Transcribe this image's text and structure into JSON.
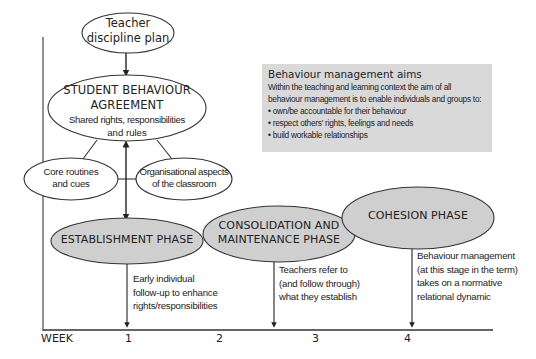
{
  "diagram": {
    "teacher_plan": {
      "line1": "Teacher",
      "line2": "discipline plan"
    },
    "agreement": {
      "title_line1": "STUDENT BEHAVIOUR",
      "title_line2": "AGREEMENT",
      "sub_line1": "Shared rights, responsibilities",
      "sub_line2": "and rules"
    },
    "core_routines": {
      "line1": "Core routines",
      "line2": "and cues"
    },
    "organisational": {
      "line1": "Organisational aspects",
      "line2": "of the classroom"
    },
    "aims": {
      "title": "Behaviour management aims",
      "intro_line1": "Within the teaching and learning context the aim of all",
      "intro_line2": "behaviour management is to enable individuals and groups to:",
      "bullets": [
        "own/be accountable for their behaviour",
        "respect others' rights, feelings and needs",
        "build workable relationships"
      ]
    },
    "phases": [
      {
        "label_line1": "ESTABLISHMENT PHASE",
        "desc": [
          "Early individual",
          "follow-up to enhance",
          "rights/responsibilities"
        ]
      },
      {
        "label_line1": "CONSOLIDATION AND",
        "label_line2": "MAINTENANCE PHASE",
        "desc": [
          "Teachers refer to",
          "(and follow through)",
          "what they establish"
        ]
      },
      {
        "label_line1": "COHESION PHASE",
        "desc": [
          "Behaviour management",
          "(at this stage in the term)",
          "takes on a normative",
          "relational dynamic"
        ]
      }
    ],
    "axis": {
      "label": "WEEK",
      "ticks": [
        "1",
        "2",
        "3",
        "4"
      ]
    },
    "colors": {
      "phase_fill": "#cfcfcf",
      "aims_fill": "#d9d9d9",
      "line": "#333333"
    }
  }
}
